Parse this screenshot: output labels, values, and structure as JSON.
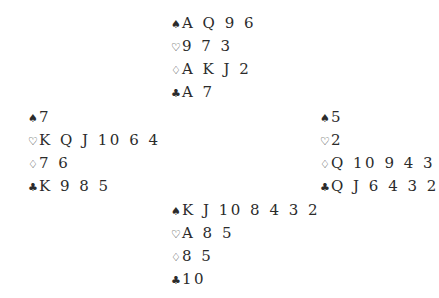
{
  "suits": {
    "spades": "♠",
    "hearts": "♡",
    "diamonds": "♢",
    "clubs": "♣"
  },
  "hands": {
    "north": {
      "spades": "A Q 9 6",
      "hearts": "9 7 3",
      "diamonds": "A K J 2",
      "clubs": "A 7"
    },
    "west": {
      "spades": "7",
      "hearts": "K Q J 10 6 4",
      "diamonds": "7 6",
      "clubs": "K 9 8 5"
    },
    "east": {
      "spades": "5",
      "hearts": "2",
      "diamonds": "Q 10 9 4 3",
      "clubs": "Q J 6 4 3 2"
    },
    "south": {
      "spades": "K J 10 8 4 3 2",
      "hearts": "A 8 5",
      "diamonds": "8 5",
      "clubs": "10"
    }
  }
}
